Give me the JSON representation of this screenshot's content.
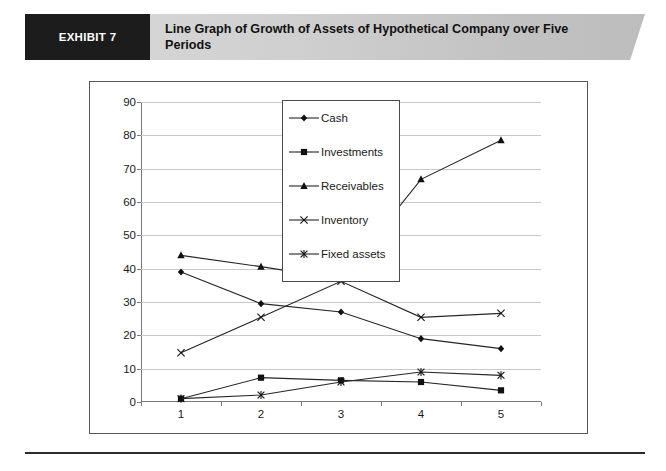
{
  "header": {
    "badge_label": "EXHIBIT 7",
    "title": "Line Graph of Growth of Assets of Hypothetical Company over Five Periods",
    "badge_bg": "#1c1c1c",
    "banner_bg": "#cfcfcf"
  },
  "chart_data": {
    "type": "line",
    "title": "",
    "xlabel": "",
    "ylabel": "",
    "categories": [
      "1",
      "2",
      "3",
      "4",
      "5"
    ],
    "x": [
      1,
      2,
      3,
      4,
      5
    ],
    "ylim": [
      0,
      90
    ],
    "ytick_labels": [
      "0",
      "10",
      "20",
      "30",
      "40",
      "50",
      "60",
      "70",
      "80",
      "90"
    ],
    "yticks": [
      0,
      10,
      20,
      30,
      40,
      50,
      60,
      70,
      80,
      90
    ],
    "grid": true,
    "legend_position": "upper-center",
    "series": [
      {
        "name": "Cash",
        "marker": "diamond",
        "values": [
          39,
          29.5,
          27,
          19,
          16
        ]
      },
      {
        "name": "Investments",
        "marker": "square",
        "values": [
          1,
          7.3,
          6.5,
          6,
          3.5
        ]
      },
      {
        "name": "Receivables",
        "marker": "triangle",
        "values": [
          44,
          40.6,
          36.8,
          66.8,
          78.5
        ]
      },
      {
        "name": "Inventory",
        "marker": "x",
        "values": [
          14.8,
          25.4,
          36.2,
          25.4,
          26.6
        ]
      },
      {
        "name": "Fixed assets",
        "marker": "asterisk",
        "values": [
          1,
          2.1,
          6,
          9,
          8
        ]
      }
    ]
  }
}
